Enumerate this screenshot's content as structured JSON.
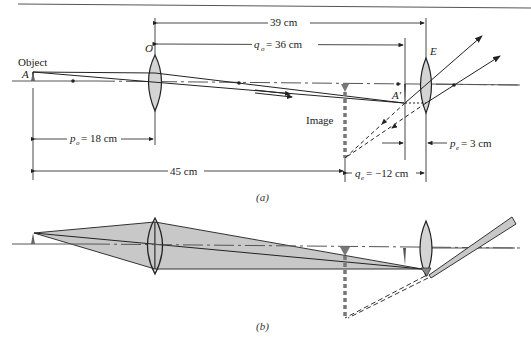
{
  "figure": {
    "panel_a": {
      "caption": "(a)",
      "labels": {
        "object": "Object",
        "point_A": "A",
        "objective": "O",
        "eyepiece": "E",
        "image": "Image",
        "point_A_prime": "A′"
      },
      "dimensions": {
        "total_lens_sep": "39 cm",
        "q_o": "q",
        "q_o_sub": "o",
        "q_o_value": "= 36 cm",
        "p_o": "p",
        "p_o_sub": "o",
        "p_o_value": "= 18 cm",
        "object_to_image": "45 cm",
        "q_e": "q",
        "q_e_sub": "e",
        "q_e_value": "= −12 cm",
        "p_e": "p",
        "p_e_sub": "e",
        "p_e_value": "= 3 cm"
      }
    },
    "panel_b": {
      "caption": "(b)"
    },
    "colors": {
      "line": "#2a2a2a",
      "lens_fill": "#d4d4d4",
      "beam_fill": "#c8c8c8",
      "axis": "#555555"
    }
  }
}
